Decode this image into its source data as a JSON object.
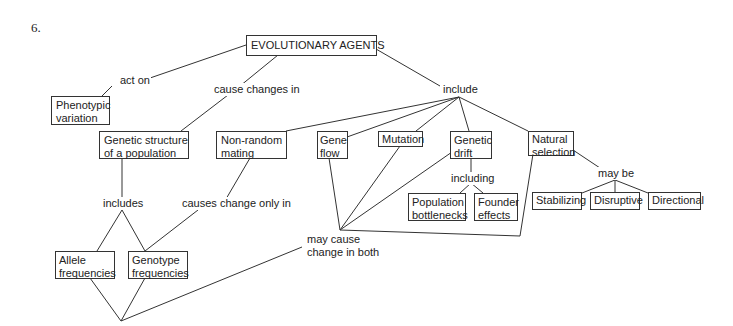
{
  "question_number": "6.",
  "nodes": {
    "root": "EVOLUTIONARY AGENTS",
    "phenotypic_variation": [
      "Phenotypic",
      "variation"
    ],
    "genetic_structure": [
      "Genetic structure",
      "of a population"
    ],
    "non_random_mating": [
      "Non-random",
      "mating"
    ],
    "gene_flow": [
      "Gene",
      "flow"
    ],
    "mutation": "Mutation",
    "genetic_drift": [
      "Genetic",
      "drift"
    ],
    "natural_selection": [
      "Natural",
      "selection"
    ],
    "population_bottlenecks": [
      "Population",
      "bottlenecks"
    ],
    "founder_effects": [
      "Founder",
      "effects"
    ],
    "stabilizing": "Stabilizing",
    "disruptive": "Disruptive",
    "directional": "Directional",
    "allele_frequencies": [
      "Allele",
      "frequencies"
    ],
    "genotype_frequencies": [
      "Genotype",
      "frequencies"
    ]
  },
  "links": {
    "act_on": "act on",
    "cause_changes_in": "cause changes in",
    "include": "include",
    "including": "including",
    "may_be": "may be",
    "includes": "includes",
    "causes_change_only_in": "causes change only in",
    "may_cause": [
      "may cause",
      "change in both"
    ]
  }
}
